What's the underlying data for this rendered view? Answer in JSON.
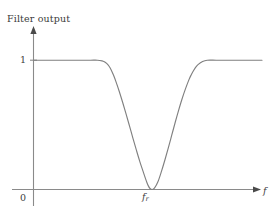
{
  "figure": {
    "title": "Filter output",
    "background_color": "#ffffff",
    "curve_color": "#808080",
    "axis_color": "#8a8a8a",
    "text_color": "#3d3d3d"
  },
  "labels": {
    "y_axis_title": "Filter output",
    "y_tick_one": "1",
    "origin": "0",
    "notch_frequency": "f",
    "notch_frequency_subscript": "r",
    "x_axis_symbol": "f"
  },
  "chart_data": {
    "type": "line",
    "title": "Filter output",
    "xlabel": "f",
    "ylabel": "Filter output",
    "grid": false,
    "legend": null,
    "xlim": [
      0,
      1
    ],
    "ylim": [
      0,
      1.05
    ],
    "x_tick_labels": [
      "0",
      "f_r"
    ],
    "y_tick_labels": [
      "0",
      "1"
    ],
    "annotations": [
      "Notch (band-stop) filter response: output is 1 in the passbands and drops to 0 at the rejection frequency f_r"
    ],
    "series": [
      {
        "name": "Notch filter response",
        "color": "#808080",
        "x": [
          0.0,
          0.05,
          0.1,
          0.15,
          0.2,
          0.25,
          0.28,
          0.3,
          0.31,
          0.32,
          0.33,
          0.34,
          0.35,
          0.36,
          0.375,
          0.39,
          0.405,
          0.42,
          0.435,
          0.45,
          0.465,
          0.48,
          0.495,
          0.502,
          0.51,
          0.52,
          0.53,
          0.545,
          0.56,
          0.575,
          0.59,
          0.605,
          0.62,
          0.635,
          0.65,
          0.665,
          0.68,
          0.69,
          0.7,
          0.71,
          0.72,
          0.74,
          0.76,
          0.8,
          0.85,
          0.9,
          0.95,
          1.0
        ],
        "y": [
          1.0,
          1.0,
          1.0,
          1.0,
          1.0,
          1.0,
          1.0,
          0.995,
          0.988,
          0.975,
          0.955,
          0.925,
          0.885,
          0.838,
          0.76,
          0.675,
          0.585,
          0.492,
          0.398,
          0.306,
          0.218,
          0.138,
          0.06,
          0.03,
          0.008,
          0.0,
          0.012,
          0.062,
          0.14,
          0.228,
          0.322,
          0.42,
          0.518,
          0.612,
          0.7,
          0.778,
          0.848,
          0.886,
          0.918,
          0.946,
          0.966,
          0.99,
          1.0,
          1.0,
          1.0,
          1.0,
          1.0,
          1.0
        ]
      }
    ]
  }
}
